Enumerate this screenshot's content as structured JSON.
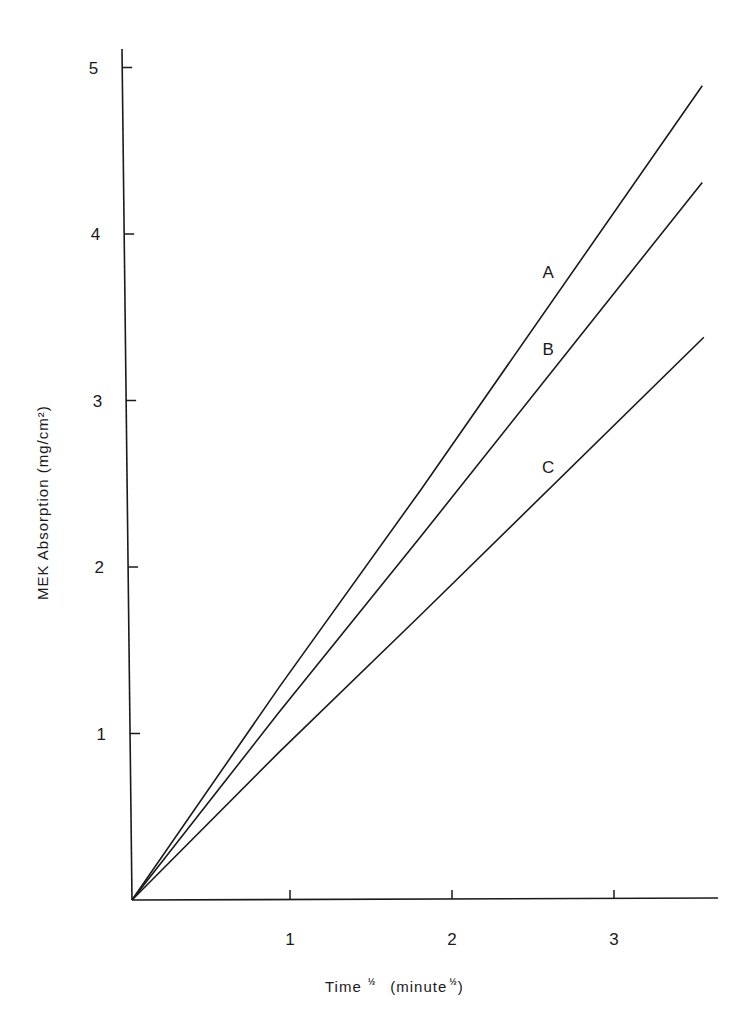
{
  "chart_data": {
    "type": "line",
    "title": "",
    "xlabel": "Time ½ (minute ½)",
    "xlabel_parts": {
      "main": "Time",
      "main_sup": "½",
      "unit_open": "(minute",
      "unit_sup": "½",
      "unit_close": ")"
    },
    "ylabel": "MEK Absorption (mg/cm²)",
    "xlim": [
      0,
      3.6
    ],
    "ylim": [
      0,
      5.2
    ],
    "x_ticks": [
      1,
      2,
      3
    ],
    "x_tick_labels": [
      "1",
      "2",
      "3"
    ],
    "y_ticks": [
      1,
      2,
      3,
      4,
      5
    ],
    "y_tick_labels": [
      "1",
      "2",
      "3",
      "4",
      "5"
    ],
    "grid": false,
    "legend": "inline labels next to lines",
    "series": [
      {
        "name": "A",
        "x": [
          0,
          0.91,
          1.78,
          3.52
        ],
        "values": [
          0,
          1.28,
          2.46,
          4.89
        ],
        "label_pos": [
          2.6,
          3.77
        ]
      },
      {
        "name": "B",
        "x": [
          0,
          0.91,
          1.78,
          3.52
        ],
        "values": [
          0,
          1.13,
          2.18,
          4.31
        ],
        "label_pos": [
          2.6,
          3.31
        ]
      },
      {
        "name": "C",
        "x": [
          0,
          0.91,
          1.78,
          3.53
        ],
        "values": [
          0,
          0.89,
          1.71,
          3.38
        ],
        "label_pos": [
          2.6,
          2.6
        ]
      }
    ]
  },
  "colors": {
    "line": "#1a1a1a",
    "background": "#ffffff"
  }
}
